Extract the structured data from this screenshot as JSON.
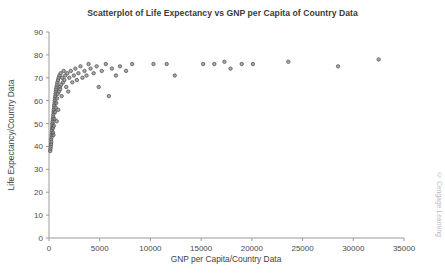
{
  "chart_data": {
    "type": "scatter",
    "title": "Scatterplot of Life Expectancy vs GNP per Capita of Country Data",
    "xlabel": "GNP per Capita/Country Data",
    "ylabel": "Life Expectancy/Country Data",
    "xlim": [
      0,
      35000
    ],
    "ylim": [
      0,
      90
    ],
    "xticks": [
      0,
      5000,
      10000,
      15000,
      20000,
      25000,
      30000,
      35000
    ],
    "yticks": [
      0,
      10,
      20,
      30,
      40,
      50,
      60,
      70,
      80,
      90
    ],
    "xtick_labels": [
      "0",
      "5000",
      "10000",
      "15000",
      "20000",
      "25000",
      "30000",
      "35000"
    ],
    "ytick_labels": [
      "0",
      "10",
      "20",
      "30",
      "40",
      "50",
      "60",
      "70",
      "80",
      "90"
    ],
    "grid": false,
    "legend": null,
    "marker": {
      "shape": "circle",
      "size": 3.4,
      "fill": "#8d8d8d",
      "stroke": "#555555",
      "stroke_width": 0.8
    },
    "series": [
      {
        "name": "Countries",
        "points": [
          [
            120,
            38
          ],
          [
            150,
            39
          ],
          [
            180,
            40
          ],
          [
            200,
            41
          ],
          [
            210,
            43
          ],
          [
            230,
            42
          ],
          [
            250,
            44
          ],
          [
            260,
            45
          ],
          [
            280,
            46
          ],
          [
            300,
            47
          ],
          [
            310,
            48
          ],
          [
            330,
            49
          ],
          [
            340,
            50
          ],
          [
            350,
            50
          ],
          [
            360,
            51
          ],
          [
            380,
            52
          ],
          [
            390,
            48
          ],
          [
            400,
            46
          ],
          [
            410,
            53
          ],
          [
            430,
            54
          ],
          [
            440,
            45
          ],
          [
            450,
            55
          ],
          [
            470,
            56
          ],
          [
            480,
            49
          ],
          [
            500,
            57
          ],
          [
            510,
            58
          ],
          [
            530,
            52
          ],
          [
            550,
            59
          ],
          [
            560,
            60
          ],
          [
            580,
            61
          ],
          [
            600,
            55
          ],
          [
            620,
            62
          ],
          [
            640,
            63
          ],
          [
            660,
            57
          ],
          [
            680,
            64
          ],
          [
            700,
            65
          ],
          [
            720,
            59
          ],
          [
            740,
            66
          ],
          [
            760,
            51
          ],
          [
            780,
            67
          ],
          [
            800,
            61
          ],
          [
            830,
            68
          ],
          [
            860,
            63
          ],
          [
            890,
            69
          ],
          [
            910,
            56
          ],
          [
            950,
            70
          ],
          [
            980,
            64
          ],
          [
            1020,
            71
          ],
          [
            1060,
            66
          ],
          [
            1100,
            65
          ],
          [
            1150,
            72
          ],
          [
            1200,
            67
          ],
          [
            1250,
            62
          ],
          [
            1300,
            70
          ],
          [
            1380,
            68
          ],
          [
            1450,
            73
          ],
          [
            1520,
            69
          ],
          [
            1600,
            71
          ],
          [
            1700,
            66
          ],
          [
            1800,
            72
          ],
          [
            1900,
            64
          ],
          [
            2000,
            70
          ],
          [
            2150,
            73
          ],
          [
            2300,
            68
          ],
          [
            2450,
            71
          ],
          [
            2600,
            74
          ],
          [
            2750,
            69
          ],
          [
            2900,
            72
          ],
          [
            3100,
            75
          ],
          [
            3300,
            70
          ],
          [
            3500,
            73
          ],
          [
            3700,
            71
          ],
          [
            3900,
            76
          ],
          [
            4100,
            74
          ],
          [
            4400,
            72
          ],
          [
            4700,
            75
          ],
          [
            4900,
            66
          ],
          [
            5200,
            73
          ],
          [
            5600,
            76
          ],
          [
            5900,
            62
          ],
          [
            6200,
            74
          ],
          [
            6600,
            71
          ],
          [
            7000,
            75
          ],
          [
            7600,
            73
          ],
          [
            8200,
            76
          ],
          [
            10300,
            76
          ],
          [
            11600,
            76
          ],
          [
            12400,
            71
          ],
          [
            15200,
            76
          ],
          [
            16300,
            76
          ],
          [
            17300,
            77
          ],
          [
            17900,
            74
          ],
          [
            19000,
            76
          ],
          [
            20100,
            76
          ],
          [
            23600,
            77
          ],
          [
            28500,
            75
          ],
          [
            32500,
            78
          ]
        ]
      }
    ]
  },
  "watermark": {
    "text": "© Cengage Learning"
  }
}
